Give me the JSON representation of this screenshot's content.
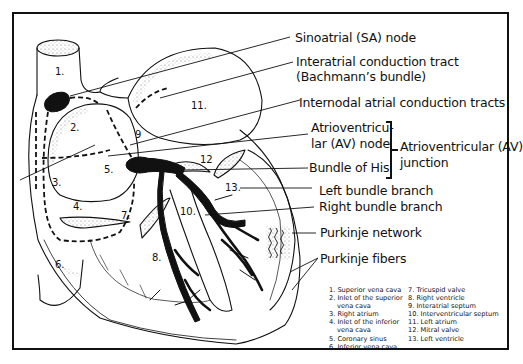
{
  "diagram": {
    "callouts": {
      "sa_node": "Sinoatrial (SA) node",
      "interatrial_1": "Interatrial conduction tract",
      "interatrial_2": "(Bachmann’s bundle)",
      "internodal": "Internodal atrial conduction tracts",
      "av_node_1": "Atrioventricu-",
      "av_node_2": "lar (AV) node",
      "bundle_his": "Bundle of His",
      "av_junction_1": "Atrioventricular (AV)",
      "av_junction_2": "junction",
      "left_bundle": "Left bundle branch",
      "right_bundle": "Right bundle branch",
      "purkinje_network": "Purkinje network",
      "purkinje_fibers": "Purkinje fibers"
    },
    "number_labels": {
      "n1": "1.",
      "n2": "2.",
      "n3": "3.",
      "n4": "4.",
      "n5": "5.",
      "n6": "6.",
      "n7": "7.",
      "n8": "8.",
      "n9": "9",
      "n10": "10.",
      "n11": "11.",
      "n12": "12",
      "n13": "13."
    },
    "legend_left": [
      "1. Superior vena cava",
      "2. Inlet of the superior",
      "vena cava",
      "3. Right atrium",
      "4. Inlet of the inferior",
      "vena cava",
      "5. Coronary sinus",
      "6. Inferior vena cava"
    ],
    "legend_right": [
      "7. Tricuspid valve",
      "8. Right ventricle",
      "9. Interatrial septum",
      "10. Interventricular septum",
      "11. Left atrium",
      "12. Mitral valve",
      "13. Left ventricle"
    ],
    "colors": {
      "ink": "#111111",
      "background": "#ffffff",
      "stipple": "#777777"
    }
  }
}
